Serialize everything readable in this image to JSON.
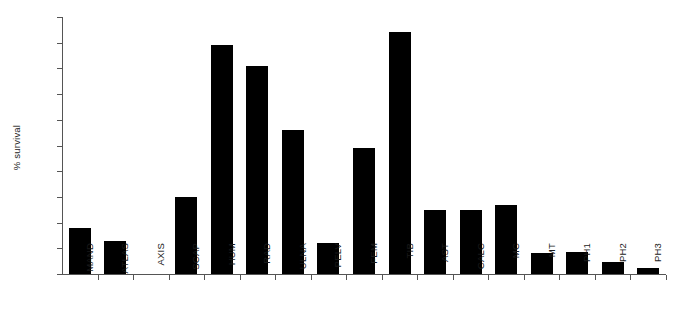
{
  "chart_data": {
    "type": "bar",
    "title": "",
    "subtitle": "",
    "xlabel": "",
    "ylabel": "% survival",
    "ylim": [
      0,
      100
    ],
    "grid": false,
    "legend": null,
    "y_axis_tick_labels": [],
    "y_axis_tick_count": 11,
    "bar_color": "#000000",
    "axis_color": "#555555",
    "categories": [
      "MAND",
      "ATLAS",
      "AXIS",
      "SCAP",
      "HUM",
      "RAD",
      "ULNA",
      "PELV",
      "FEM",
      "TIB",
      "AST",
      "CALC",
      "MC",
      "MT",
      "PH1",
      "PH2",
      "PH3"
    ],
    "values": [
      18,
      13,
      0,
      30,
      89,
      81,
      56,
      12,
      49,
      94,
      25,
      25,
      27,
      8,
      8.5,
      4.5,
      2.5
    ],
    "series": [
      {
        "name": "% survival",
        "values": [
          18,
          13,
          0,
          30,
          89,
          81,
          56,
          12,
          49,
          94,
          25,
          25,
          27,
          8,
          8.5,
          4.5,
          2.5
        ]
      }
    ]
  },
  "axis": {
    "y_label": "% survival"
  }
}
